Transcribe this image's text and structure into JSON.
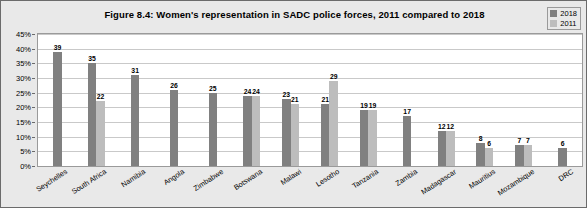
{
  "figure": {
    "title": "Figure 8.4: Women's representation in SADC police forces, 2011 compared to 2018"
  },
  "legend": {
    "position": "top-right",
    "entries": [
      {
        "label": "2018",
        "color": "#808080"
      },
      {
        "label": "2011",
        "color": "#bdbdbd"
      }
    ]
  },
  "axis": {
    "y_ticks": [
      "0%",
      "5%",
      "10%",
      "15%",
      "20%",
      "25%",
      "30%",
      "35%",
      "40%",
      "45%"
    ]
  },
  "chart_data": {
    "type": "bar",
    "title": "Figure 8.4: Women's representation in SADC police forces, 2011 compared to 2018",
    "xlabel": "",
    "ylabel": "",
    "ylim": [
      0,
      45
    ],
    "ytick_step": 5,
    "grid": true,
    "legend_position": "top-right",
    "categories": [
      "Seychelles",
      "South Africa",
      "Namibia",
      "Angola",
      "Zimbabwe",
      "Botswana",
      "Malawi",
      "Lesotho",
      "Tanzania",
      "Zambia",
      "Madagascar",
      "Mauritius",
      "Mozambique",
      "DRC"
    ],
    "series": [
      {
        "name": "2018",
        "color": "#808080",
        "values": [
          39,
          35,
          31,
          26,
          25,
          24,
          23,
          21,
          19,
          17,
          12,
          8,
          7,
          6
        ]
      },
      {
        "name": "2011",
        "color": "#bdbdbd",
        "values": [
          null,
          22,
          null,
          null,
          null,
          24,
          21,
          29,
          19,
          null,
          12,
          6,
          7,
          null
        ]
      }
    ],
    "data_labels": [
      {
        "category": "Seychelles",
        "2018": "39",
        "2011": ""
      },
      {
        "category": "South Africa",
        "2018": "35",
        "2011": "22"
      },
      {
        "category": "Namibia",
        "2018": "31",
        "2011": ""
      },
      {
        "category": "Angola",
        "2018": "26",
        "2011": ""
      },
      {
        "category": "Zimbabwe",
        "2018": "25",
        "2011": ""
      },
      {
        "category": "Botswana",
        "2018": "24",
        "2011": "24"
      },
      {
        "category": "Malawi",
        "2018": "23",
        "2011": "21"
      },
      {
        "category": "Lesotho",
        "2018": "21",
        "2011": "29"
      },
      {
        "category": "Tanzania",
        "2018": "19",
        "2011": "19"
      },
      {
        "category": "Zambia",
        "2018": "17",
        "2011": ""
      },
      {
        "category": "Madagascar",
        "2018": "12",
        "2011": "12"
      },
      {
        "category": "Mauritius",
        "2018": "8",
        "2011": "6"
      },
      {
        "category": "Mozambique",
        "2018": "7",
        "2011": "7"
      },
      {
        "category": "DRC",
        "2018": "6",
        "2011": ""
      }
    ]
  }
}
